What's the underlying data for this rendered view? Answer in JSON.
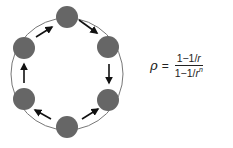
{
  "diagram": {
    "type": "cycle",
    "ring": {
      "cx": 67,
      "cy": 74,
      "r": 56,
      "stroke": "#777777"
    },
    "node_color": "#666666",
    "arrow_color": "#111111",
    "nodes": [
      {
        "id": "top",
        "cx": 67,
        "cy": 17,
        "r": 11
      },
      {
        "id": "upper-right",
        "cx": 108,
        "cy": 47,
        "r": 11
      },
      {
        "id": "lower-right",
        "cx": 108,
        "cy": 100,
        "r": 11
      },
      {
        "id": "bottom",
        "cx": 67,
        "cy": 127,
        "r": 11
      },
      {
        "id": "lower-left",
        "cx": 24,
        "cy": 99,
        "r": 11
      },
      {
        "id": "upper-left",
        "cx": 24,
        "cy": 48,
        "r": 11
      }
    ],
    "arrows": [
      {
        "from": "upper-left",
        "to": "top",
        "x1": 36,
        "y1": 37,
        "x2": 52,
        "y2": 27
      },
      {
        "from": "top",
        "to": "upper-right",
        "x1": 79,
        "y1": 20,
        "x2": 97,
        "y2": 33
      },
      {
        "from": "upper-right",
        "to": "lower-right",
        "x1": 109,
        "y1": 64,
        "x2": 109,
        "y2": 83
      },
      {
        "from": "bottom",
        "to": "lower-right",
        "x1": 82,
        "y1": 119,
        "x2": 98,
        "y2": 109
      },
      {
        "from": "bottom",
        "to": "lower-left",
        "x1": 51,
        "y1": 119,
        "x2": 35,
        "y2": 110
      },
      {
        "from": "lower-left",
        "to": "upper-left",
        "x1": 24,
        "y1": 83,
        "x2": 24,
        "y2": 64
      }
    ]
  },
  "formula": {
    "lhs": "ρ",
    "equals": "=",
    "numerator": {
      "prefix": "1−1/",
      "var": "r"
    },
    "denominator": {
      "prefix": "1−1/",
      "var": "r",
      "exponent": "n"
    }
  }
}
